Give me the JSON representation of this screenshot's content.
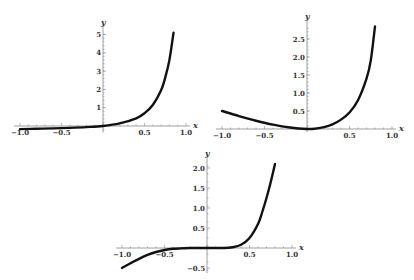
{
  "chart_data": [
    {
      "type": "line",
      "title": "",
      "xlabel": "x",
      "ylabel": "y",
      "xlim": [
        -1.0,
        1.0
      ],
      "ylim": [
        -0.2,
        5.2
      ],
      "x_ticks": [
        "-1.0",
        "-0.5",
        "0.5",
        "1.0"
      ],
      "y_ticks": [
        "1",
        "2",
        "3",
        "4",
        "5"
      ],
      "grid": false,
      "series": [
        {
          "name": "f1",
          "x": [
            -1.0,
            -0.8,
            -0.6,
            -0.4,
            -0.2,
            0.0,
            0.2,
            0.4,
            0.5,
            0.6,
            0.7,
            0.75,
            0.8,
            0.85
          ],
          "values": [
            -0.17,
            -0.15,
            -0.13,
            -0.1,
            -0.06,
            0.0,
            0.14,
            0.42,
            0.7,
            1.15,
            1.95,
            2.65,
            3.6,
            5.1
          ]
        }
      ],
      "layout": {
        "origin_px": [
          103,
          126
        ],
        "x_scale": 83,
        "y_scale": 18.3
      }
    },
    {
      "type": "line",
      "title": "",
      "xlabel": "x",
      "ylabel": "y",
      "xlim": [
        -1.0,
        1.0
      ],
      "ylim": [
        0,
        2.9
      ],
      "x_ticks": [
        "-1.0",
        "-0.5",
        "0.5",
        "1.0"
      ],
      "y_ticks": [
        "0.5",
        "1.0",
        "1.5",
        "2.0",
        "2.5"
      ],
      "grid": false,
      "series": [
        {
          "name": "f2",
          "x": [
            -1.0,
            -0.8,
            -0.6,
            -0.4,
            -0.2,
            0.0,
            0.1,
            0.2,
            0.3,
            0.4,
            0.5,
            0.6,
            0.7,
            0.75,
            0.8
          ],
          "values": [
            0.5,
            0.36,
            0.23,
            0.12,
            0.04,
            0.0,
            0.01,
            0.05,
            0.13,
            0.26,
            0.46,
            0.8,
            1.4,
            1.9,
            2.85
          ]
        }
      ],
      "layout": {
        "origin_px": [
          307,
          129
        ],
        "x_scale": 85,
        "y_scale": 36
      }
    },
    {
      "type": "line",
      "title": "",
      "xlabel": "x",
      "ylabel": "y",
      "xlim": [
        -1.0,
        1.0
      ],
      "ylim": [
        -0.55,
        2.15
      ],
      "x_ticks": [
        "-1.0",
        "-0.5",
        "0.5",
        "1.0"
      ],
      "y_ticks": [
        "-0.5",
        "0.5",
        "1.0",
        "1.5",
        "2.0"
      ],
      "grid": false,
      "series": [
        {
          "name": "f3",
          "x": [
            -1.0,
            -0.9,
            -0.8,
            -0.7,
            -0.6,
            -0.5,
            -0.4,
            -0.3,
            -0.2,
            0.0,
            0.2,
            0.3,
            0.4,
            0.5,
            0.6,
            0.65,
            0.7,
            0.75,
            0.8
          ],
          "values": [
            -0.5,
            -0.38,
            -0.27,
            -0.17,
            -0.1,
            -0.05,
            -0.02,
            -0.01,
            0.0,
            0.0,
            0.0,
            0.02,
            0.08,
            0.25,
            0.6,
            0.9,
            1.25,
            1.65,
            2.1
          ]
        }
      ],
      "layout": {
        "origin_px": [
          207,
          248
        ],
        "x_scale": 85,
        "y_scale": 40
      }
    }
  ]
}
